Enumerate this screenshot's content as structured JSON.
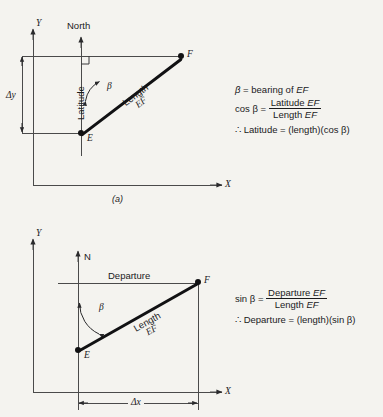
{
  "figure": {
    "title_a": "(a)",
    "upper": {
      "axis_y_label": "Y",
      "axis_x_label": "X",
      "north_label": "North",
      "latitude_label": "Latitude",
      "beta_label": "β",
      "length_label_line1": "Length",
      "length_label_line2": "EF",
      "point_e": "E",
      "point_f": "F",
      "delta_y_label": "Δy",
      "right_angle_marker": "right-angle"
    },
    "lower": {
      "axis_y_label": "Y",
      "axis_x_label": "X",
      "north_label": "N",
      "departure_label": "Departure",
      "beta_label": "β",
      "length_label_line1": "Length",
      "length_label_line2": "EF",
      "point_e": "E",
      "point_f": "F",
      "delta_x_label": "Δx"
    }
  },
  "equations": {
    "upper": {
      "line1_lhs": "β",
      "line1_eq": "=",
      "line1_rhs": "bearing of",
      "line1_rhs_italic": "EF",
      "line2_lhs": "cos β",
      "line2_eq": "=",
      "line2_num_text": "Latitude",
      "line2_num_italic": "EF",
      "line2_den_text": "Length",
      "line2_den_italic": "EF",
      "line3_therefore": "∴",
      "line3_text": "Latitude = (length)(cos β)"
    },
    "lower": {
      "line1_lhs": "sin β",
      "line1_eq": "=",
      "line1_num_text": "Departure",
      "line1_num_italic": "EF",
      "line1_den_text": "Length",
      "line1_den_italic": "EF",
      "line2_therefore": "∴",
      "line2_text": "Departure = (length)(sin β)"
    }
  },
  "colors": {
    "background": "#f4f3ef",
    "thin_line": "#4a4a4a",
    "thick_line": "#111113",
    "text": "#1a1a1c"
  }
}
